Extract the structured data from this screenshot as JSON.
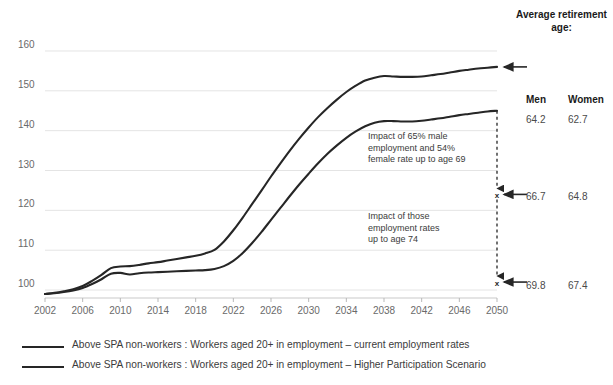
{
  "chart_data": {
    "type": "line",
    "title": "",
    "xlabel": "",
    "ylabel": "",
    "xlim": [
      2002,
      2050
    ],
    "ylim": [
      98,
      162
    ],
    "ytick_values": [
      100,
      110,
      120,
      130,
      140,
      150,
      160
    ],
    "ytick_labels": [
      "100",
      "110",
      "120",
      "130",
      "140",
      "150",
      "160"
    ],
    "xtick_labels": [
      "2002",
      "2006",
      "2010",
      "2014",
      "2018",
      "2022",
      "2026",
      "2030",
      "2034",
      "2038",
      "2042",
      "2046",
      "2050"
    ],
    "xtick_values": [
      2002,
      2006,
      2010,
      2014,
      2018,
      2022,
      2026,
      2030,
      2034,
      2038,
      2042,
      2046,
      2050
    ],
    "grid": "horizontal",
    "legend_position": "bottom-left",
    "line_color": "#262626",
    "x": [
      2002,
      2003,
      2004,
      2005,
      2006,
      2007,
      2008,
      2009,
      2010,
      2011,
      2012,
      2013,
      2014,
      2015,
      2016,
      2017,
      2018,
      2019,
      2020,
      2021,
      2022,
      2023,
      2024,
      2025,
      2026,
      2027,
      2028,
      2029,
      2030,
      2031,
      2032,
      2033,
      2034,
      2035,
      2036,
      2037,
      2038,
      2039,
      2040,
      2041,
      2042,
      2043,
      2044,
      2045,
      2046,
      2047,
      2048,
      2049,
      2050
    ],
    "series": [
      {
        "name": "Above SPA non-workers : Workers aged 20+ in employment – current employment rates",
        "values": [
          99.0,
          99.3,
          99.7,
          100.2,
          101.0,
          102.3,
          103.8,
          105.5,
          105.9,
          106.0,
          106.3,
          106.7,
          107.0,
          107.4,
          107.8,
          108.2,
          108.6,
          109.2,
          110.1,
          112.2,
          115.0,
          118.2,
          121.6,
          125.0,
          128.5,
          131.8,
          135.0,
          138.0,
          140.8,
          143.4,
          145.7,
          147.8,
          149.7,
          151.3,
          152.6,
          153.3,
          153.7,
          153.6,
          153.5,
          153.5,
          153.6,
          153.9,
          154.2,
          154.6,
          155.0,
          155.3,
          155.6,
          155.8,
          156.0
        ]
      },
      {
        "name": "Above SPA non-workers : Workers aged 20+ in employment – Higher Participation Scenario",
        "values": [
          99.0,
          99.2,
          99.5,
          99.9,
          100.5,
          101.5,
          102.7,
          104.1,
          104.3,
          103.9,
          104.2,
          104.4,
          104.5,
          104.6,
          104.7,
          104.8,
          104.9,
          105.0,
          105.3,
          106.0,
          107.3,
          109.3,
          111.8,
          114.6,
          117.6,
          120.6,
          123.6,
          126.5,
          129.2,
          131.8,
          134.2,
          136.3,
          138.2,
          139.8,
          141.1,
          142.0,
          142.4,
          142.4,
          142.3,
          142.3,
          142.5,
          142.8,
          143.1,
          143.5,
          143.9,
          144.2,
          144.5,
          144.8,
          145.0
        ]
      }
    ],
    "annotations": [
      {
        "id": "annot-1",
        "text": "Impact of 65% male\nemployment and 54%\nfemale rate up to age 69"
      },
      {
        "id": "annot-2",
        "text": "Impact of those\nemployment rates\nup to age 74"
      }
    ],
    "markers": [
      {
        "label": "marker-66-7",
        "y_value": 124.0
      },
      {
        "label": "marker-69-8",
        "y_value": 102.0
      }
    ]
  },
  "side_table": {
    "title": "Average\nretirement age:",
    "columns": [
      "Men",
      "Women"
    ],
    "rows": [
      {
        "men": "64.2",
        "women": "62.7"
      },
      {
        "men": "66.7",
        "women": "64.8"
      },
      {
        "men": "69.8",
        "women": "67.4"
      }
    ]
  },
  "legend": {
    "items": [
      {
        "label": "Above SPA non-workers : Workers aged 20+ in employment – current employment rates"
      },
      {
        "label": "Above SPA non-workers : Workers aged 20+ in employment – Higher Participation Scenario"
      }
    ]
  }
}
